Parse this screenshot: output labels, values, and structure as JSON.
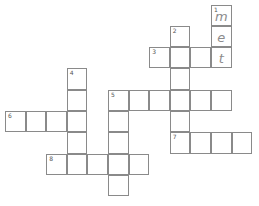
{
  "puzzle": {
    "type": "crossword",
    "grid_origin": {
      "x": 5.5,
      "y": 5
    },
    "cell_pitch": {
      "x": 20.6,
      "y": 21.3
    },
    "border_color": "#8a8a8a",
    "letter_color": "#8c8c8c",
    "number_color": "#555555",
    "entries": [
      {
        "number": "1",
        "direction": "down",
        "col": 10,
        "row": 0,
        "length": 3,
        "letters": [
          "m",
          "e",
          "t"
        ]
      },
      {
        "number": "2",
        "direction": "down",
        "col": 8,
        "row": 1,
        "length": 6,
        "letters": []
      },
      {
        "number": "3",
        "direction": "across",
        "col": 7,
        "row": 2,
        "length": 4,
        "letters": []
      },
      {
        "number": "4",
        "direction": "down",
        "col": 3,
        "row": 3,
        "length": 5,
        "letters": []
      },
      {
        "number": "5",
        "direction": "across",
        "col": 5,
        "row": 4,
        "length": 6,
        "letters": []
      },
      {
        "number": "5",
        "direction": "down",
        "col": 5,
        "row": 4,
        "length": 5,
        "letters": []
      },
      {
        "number": "6",
        "direction": "across",
        "col": 0,
        "row": 5,
        "length": 4,
        "letters": []
      },
      {
        "number": "7",
        "direction": "across",
        "col": 8,
        "row": 6,
        "length": 4,
        "letters": []
      },
      {
        "number": "8",
        "direction": "across",
        "col": 2,
        "row": 7,
        "length": 5,
        "letters": []
      }
    ]
  }
}
